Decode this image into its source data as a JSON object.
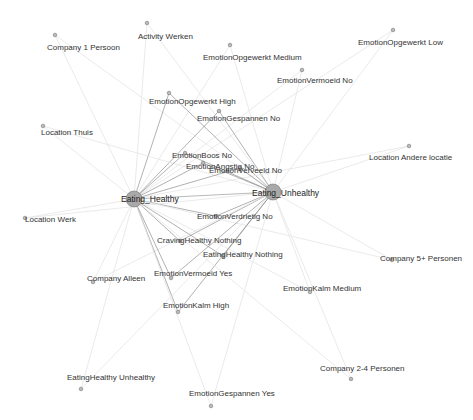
{
  "graph": {
    "type": "network",
    "background": "#ffffff",
    "colors": {
      "node_fill": "#bbbbbb",
      "node_stroke": "#777777",
      "hub_fill": "#a9a9a9",
      "edge_strong": "#8a8a8a",
      "edge_weak": "#e4e4e4",
      "label": "#333333"
    },
    "hubs": [
      {
        "id": "eating_healthy",
        "label": "Eating_Healthy",
        "x": 134,
        "y": 199,
        "r": 8,
        "lx": 121,
        "ly": 202
      },
      {
        "id": "eating_unhealthy",
        "label": "Eating_Unhealthy",
        "x": 273,
        "y": 192,
        "r": 8,
        "lx": 252,
        "ly": 196
      }
    ],
    "nodes": [
      {
        "id": "n1",
        "label": "Company 1 Persoon",
        "x": 55,
        "y": 35,
        "lx": 47,
        "ly": 50
      },
      {
        "id": "n2",
        "label": "Activity Werken",
        "x": 147,
        "y": 23,
        "lx": 138,
        "ly": 39
      },
      {
        "id": "n3",
        "label": "EmotionOpgewerkt Medium",
        "x": 230,
        "y": 45,
        "lx": 203,
        "ly": 60
      },
      {
        "id": "n4",
        "label": "EmotionOpgewerkt Low",
        "x": 393,
        "y": 30,
        "lx": 358,
        "ly": 45
      },
      {
        "id": "n5",
        "label": "EmotionVermoeid No",
        "x": 302,
        "y": 70,
        "lx": 277,
        "ly": 83
      },
      {
        "id": "n6",
        "label": "EmotionOpgewerkt High",
        "x": 169,
        "y": 93,
        "lx": 149,
        "ly": 104
      },
      {
        "id": "n7",
        "label": "EmotionGespannen No",
        "x": 219,
        "y": 111,
        "lx": 197,
        "ly": 121
      },
      {
        "id": "n8",
        "label": "Location Thuis",
        "x": 43,
        "y": 126,
        "lx": 41,
        "ly": 135
      },
      {
        "id": "n9",
        "label": "Location Andere locatie",
        "x": 409,
        "y": 146,
        "lx": 369,
        "ly": 160
      },
      {
        "id": "n10",
        "label": "EmotionBoos No",
        "x": 185,
        "y": 153,
        "lx": 172,
        "ly": 158
      },
      {
        "id": "n11",
        "label": "EmotionAngstig No",
        "x": 203,
        "y": 163,
        "lx": 186,
        "ly": 169
      },
      {
        "id": "n12",
        "label": "EmotionVerveeld No",
        "x": 240,
        "y": 168,
        "lx": 209,
        "ly": 173
      },
      {
        "id": "n13",
        "label": "EmotionVerdrietig No",
        "x": 216,
        "y": 216,
        "lx": 197,
        "ly": 219
      },
      {
        "id": "n14",
        "label": "Location Werk",
        "x": 25,
        "y": 218,
        "lx": 25,
        "ly": 222
      },
      {
        "id": "n15",
        "label": "CravingHealthy Nothing",
        "x": 180,
        "y": 241,
        "lx": 157,
        "ly": 243
      },
      {
        "id": "n16",
        "label": "EatingHealthy Nothing",
        "x": 223,
        "y": 256,
        "lx": 203,
        "ly": 257
      },
      {
        "id": "n17",
        "label": "Company 5+ Personen",
        "x": 392,
        "y": 260,
        "lx": 380,
        "ly": 261
      },
      {
        "id": "n18",
        "label": "Company Alleen",
        "x": 93,
        "y": 282,
        "lx": 87,
        "ly": 281
      },
      {
        "id": "n19",
        "label": "EmotionVermoeid Yes",
        "x": 171,
        "y": 278,
        "lx": 154,
        "ly": 276
      },
      {
        "id": "n20",
        "label": "EmotionKalm Medium",
        "x": 310,
        "y": 292,
        "lx": 283,
        "ly": 291
      },
      {
        "id": "n21",
        "label": "EmotionKalm High",
        "x": 178,
        "y": 312,
        "lx": 163,
        "ly": 308
      },
      {
        "id": "n22",
        "label": "Company 2-4 Personen",
        "x": 351,
        "y": 379,
        "lx": 320,
        "ly": 371
      },
      {
        "id": "n23",
        "label": "EatingHealthy Unhealthy",
        "x": 81,
        "y": 389,
        "lx": 67,
        "ly": 380
      },
      {
        "id": "n24",
        "label": "EmotionGespannen Yes",
        "x": 211,
        "y": 406,
        "lx": 189,
        "ly": 396
      }
    ]
  }
}
